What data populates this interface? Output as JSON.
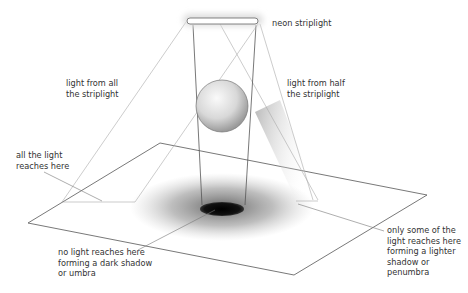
{
  "diagram": {
    "labels": {
      "striplight": "neon striplight",
      "light_all": "light from all\nthe striplight",
      "light_half": "light from half\nthe striplight",
      "all_light": "all the light\nreaches here",
      "umbra": "no light reaches here\nforming a dark shadow\nor umbra",
      "penumbra": "only some of the\nlight reaches here\nforming a lighter\nshadow or\npenumbra"
    },
    "colors": {
      "line_dark": "#555555",
      "line_light": "#aaaaaa",
      "umbra": "#111111",
      "penumbra": "#888888"
    }
  }
}
